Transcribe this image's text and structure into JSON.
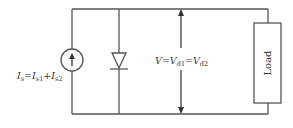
{
  "diagram": {
    "type": "circuit",
    "colors": {
      "wire": "#555555",
      "text": "#333333",
      "background": "#ffffff"
    },
    "components": {
      "current_source": {
        "label_main": "I",
        "label_main_sub": "s",
        "eq1": "=",
        "term1": "I",
        "term1_sub": "s1",
        "plus": "+",
        "term2": "I",
        "term2_sub": "s2",
        "direction": "up"
      },
      "diode": {
        "orientation": "cathode-down"
      },
      "voltage": {
        "label_main": "V",
        "eq1": "=",
        "term1": "V",
        "term1_sub": "d1",
        "eq2": "=",
        "term2": "V",
        "term2_sub": "d2"
      },
      "load": {
        "label": "Load"
      }
    }
  }
}
